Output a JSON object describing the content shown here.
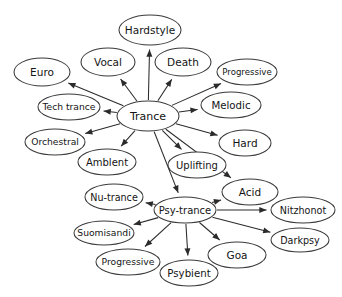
{
  "diagram": {
    "type": "node-link-graph",
    "background_color": "#ffffff",
    "node_fill_color": "#ffffff",
    "node_stroke_color": "#3a3a3a",
    "edge_color": "#2b2b2b",
    "label_color": "#141414",
    "nodes": [
      {
        "id": "hardstyle",
        "label": "Hardstyle",
        "cx": 150,
        "cy": 30,
        "rx": 31,
        "ry": 15,
        "font_size": 10.5
      },
      {
        "id": "vocal",
        "label": "Vocal",
        "cx": 108,
        "cy": 62,
        "rx": 27,
        "ry": 14,
        "font_size": 10.5
      },
      {
        "id": "death",
        "label": "Death",
        "cx": 183,
        "cy": 62,
        "rx": 28,
        "ry": 14,
        "font_size": 10.5
      },
      {
        "id": "euro",
        "label": "Euro",
        "cx": 42,
        "cy": 72,
        "rx": 28,
        "ry": 14,
        "font_size": 10.5
      },
      {
        "id": "progressive_top",
        "label": "Progressive",
        "cx": 247,
        "cy": 72,
        "rx": 30,
        "ry": 13,
        "font_size": 8.6
      },
      {
        "id": "tech_trance",
        "label": "Tech trance",
        "cx": 69,
        "cy": 107,
        "rx": 31,
        "ry": 13,
        "font_size": 9.2
      },
      {
        "id": "trance",
        "label": "Trance",
        "cx": 148,
        "cy": 116,
        "rx": 31,
        "ry": 15,
        "font_size": 11
      },
      {
        "id": "melodic",
        "label": "Melodic",
        "cx": 231,
        "cy": 105,
        "rx": 30,
        "ry": 13,
        "font_size": 10.2
      },
      {
        "id": "orchestral",
        "label": "Orchestral",
        "cx": 55,
        "cy": 142,
        "rx": 30,
        "ry": 13,
        "font_size": 9.2
      },
      {
        "id": "hard",
        "label": "Hard",
        "cx": 245,
        "cy": 143,
        "rx": 26,
        "ry": 13,
        "font_size": 10.5
      },
      {
        "id": "amblent",
        "label": "Amblent",
        "cx": 107,
        "cy": 162,
        "rx": 29,
        "ry": 13,
        "font_size": 10
      },
      {
        "id": "uplifting",
        "label": "Uplifting",
        "cx": 197,
        "cy": 165,
        "rx": 29,
        "ry": 13,
        "font_size": 10
      },
      {
        "id": "acid",
        "label": "Acid",
        "cx": 250,
        "cy": 192,
        "rx": 28,
        "ry": 13,
        "font_size": 10.5
      },
      {
        "id": "nu_trance",
        "label": "Nu-trance",
        "cx": 114,
        "cy": 197,
        "rx": 29,
        "ry": 13,
        "font_size": 9.6
      },
      {
        "id": "psy_trance",
        "label": "Psy-trance",
        "cx": 185,
        "cy": 210,
        "rx": 31,
        "ry": 13,
        "font_size": 10
      },
      {
        "id": "nitzhonot",
        "label": "Nitzhonot",
        "cx": 303,
        "cy": 210,
        "rx": 32,
        "ry": 13,
        "font_size": 9.6
      },
      {
        "id": "suomisandi",
        "label": "Suomisandi",
        "cx": 104,
        "cy": 233,
        "rx": 30,
        "ry": 12,
        "font_size": 9.2
      },
      {
        "id": "darkpsy",
        "label": "Darkpsy",
        "cx": 300,
        "cy": 240,
        "rx": 29,
        "ry": 12,
        "font_size": 9.6
      },
      {
        "id": "goa",
        "label": "Goa",
        "cx": 237,
        "cy": 255,
        "rx": 29,
        "ry": 13,
        "font_size": 10.5
      },
      {
        "id": "progressive_bottom",
        "label": "Progressive",
        "cx": 128,
        "cy": 262,
        "rx": 32,
        "ry": 13,
        "font_size": 9.2
      },
      {
        "id": "psybient",
        "label": "Psybient",
        "cx": 189,
        "cy": 273,
        "rx": 29,
        "ry": 13,
        "font_size": 10.2
      }
    ],
    "edges": [
      {
        "from": "trance",
        "to": "hardstyle"
      },
      {
        "from": "trance",
        "to": "vocal"
      },
      {
        "from": "trance",
        "to": "death"
      },
      {
        "from": "trance",
        "to": "euro"
      },
      {
        "from": "trance",
        "to": "progressive_top"
      },
      {
        "from": "trance",
        "to": "tech_trance"
      },
      {
        "from": "trance",
        "to": "melodic"
      },
      {
        "from": "trance",
        "to": "orchestral"
      },
      {
        "from": "trance",
        "to": "hard"
      },
      {
        "from": "trance",
        "to": "amblent"
      },
      {
        "from": "trance",
        "to": "uplifting"
      },
      {
        "from": "trance",
        "to": "acid"
      },
      {
        "from": "trance",
        "to": "psy_trance"
      },
      {
        "from": "psy_trance",
        "to": "nu_trance"
      },
      {
        "from": "psy_trance",
        "to": "suomisandi"
      },
      {
        "from": "psy_trance",
        "to": "progressive_bottom"
      },
      {
        "from": "psy_trance",
        "to": "psybient"
      },
      {
        "from": "psy_trance",
        "to": "goa"
      },
      {
        "from": "psy_trance",
        "to": "acid"
      },
      {
        "from": "psy_trance",
        "to": "nitzhonot"
      },
      {
        "from": "psy_trance",
        "to": "darkpsy"
      }
    ]
  }
}
